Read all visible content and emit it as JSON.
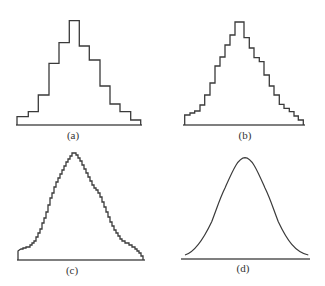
{
  "style": {
    "line_color": "#3a3a3a",
    "axis_color": "#555555",
    "background": "#ffffff"
  },
  "panels": [
    {
      "id": "a",
      "label": "(a)",
      "label_pos": [
        73,
        130
      ],
      "kind": "histogram",
      "baseline": {
        "x1": 16,
        "x2": 142,
        "y": 125
      },
      "points": "17,125 17,116.7 28.3,116.7 28.3,111.7 38.3,111.7 38.3,95 49,95 49,63.3 59,63.3 59,42.7 69.3,42.7 69.3,20.7 79.3,20.7 79.3,46 89.3,46 89.3,60 100,60 100,86 110,86 110,104 120,104 120,111.7 130.7,111.7 130.7,120 140.7,120 140.7,125"
    },
    {
      "id": "b",
      "label": "(b)",
      "label_pos": [
        245,
        130
      ],
      "kind": "histogram",
      "baseline": {
        "x1": 183,
        "x2": 305,
        "y": 125
      },
      "points": "184.7,125 184.7,115 190,115 190,113 194.7,113 194.7,111 200,111 200,105 204.7,105 204.7,95 210,95 210,83 215,83 215,66 220,66 220,57 225,57 225,45 230,45 230,35 235,35 235,22 244,22 244,37.7 249.3,37.7 249.3,48 254,48 254,57.7 259.3,57.7 259.3,61.7 264,61.7 264,75 269.3,75 269.3,86 274,86 274,95 279.3,95 279.3,104.3 284,104.3 284,108.3 289.3,108.3 289.3,111.7 294,111.7 294,116 298.3,116 298.3,120 303.3,120 303.3,125"
    },
    {
      "id": "c",
      "label": "(c)",
      "label_pos": [
        72,
        265
      ],
      "kind": "histogram",
      "baseline": {
        "x1": 17,
        "x2": 145,
        "y": 260
      },
      "points": "18,260 18,251 19.3,250 21,249 23,249 23,248 26,248 26,247 30,247 30,245 32,245 32,243 34,243 34,241 36,241 36,237 38,237 38,233 40,233 40,229 42,229 42,223 44,223 44,218 46,218 46,212 48,212 48,205 50,205 50,198 52,198 52,193 54,193 54,187 56,187 56,182 58,182 58,178 60,178 60,174 62,174 62,170 64,170 64,166 66,166 66,162 68,162 68,159 70,159 70,156 72,156 72,153 76,153 76,155 78,155 78,158 80,158 80,161 82,161 82,165 84,165 84,169 86,169 86,173 88,173 88,177 90,177 90,181 92,181 92,185 94,185 94,188 96,188 96,190 98,190 98,193 100,193 100,197 102,197 102,202 104,202 104,207 106,207 106,212 108,212 108,217 110,217 110,222 112,222 112,226 114,226 114,230 116,230 116,233 118,233 118,236 120,236 120,239 122,239 122,241 125,241 125,243 129,243 129,245 132,245 132,247 135,247 135,249 137,249 137,251 139,251 139,253 141,253 141,256 143,256 143,260"
    },
    {
      "id": "d",
      "label": "(d)",
      "label_pos": [
        243,
        263
      ],
      "kind": "curve",
      "baseline": {
        "x1": 181,
        "x2": 310,
        "y": 259
      },
      "path": "M185,255 C195,252 203,240 211.7,221.7 C217,208 220,198 225,188 C233,170 238,158 245,157.7 C252,158 257,170 265,188 C270,198 273,208 278.3,221.7 C287,240 295,252 308.3,255"
    }
  ]
}
